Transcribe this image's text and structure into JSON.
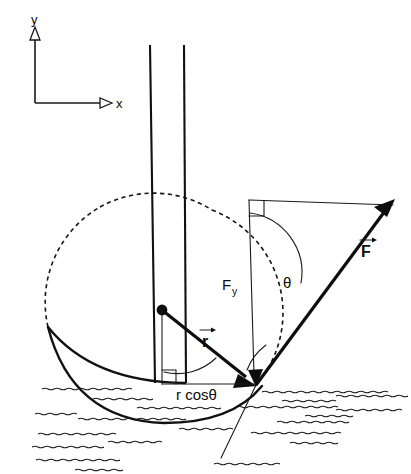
{
  "figure": {
    "background_color": "#ffffff",
    "line_color": "#111111",
    "width": 411,
    "height": 474
  },
  "axes": {
    "y_label": "y",
    "x_label": "x",
    "origin_x": 35,
    "origin_y": 103,
    "y_tip_y": 30,
    "x_tip_x": 110,
    "arrowhead_style": "hollow-triangle"
  },
  "labels": {
    "force_vector": "F",
    "radius_vector": "r",
    "force_y_component": "F",
    "force_y_subscript": "y",
    "angle": "θ",
    "lever_arm": "r cosθ"
  },
  "geometry": {
    "pivot_x": 256,
    "pivot_y": 385,
    "mast_top_dot_x": 162,
    "mast_top_dot_y": 310,
    "force_tip_x": 393,
    "force_tip_y": 205,
    "triangle_top_y": 200,
    "circle_center_x": 152,
    "circle_center_y": 305,
    "circle_radius": 110,
    "waterline_y": 385
  },
  "elements": {
    "masts": "two tapered vertical spars",
    "hull": "crescent boat hull",
    "water": "hatched wavy waterlines",
    "dashed_arc": "dashed circle of radius r about hull center",
    "right_angle_markers": 2
  }
}
